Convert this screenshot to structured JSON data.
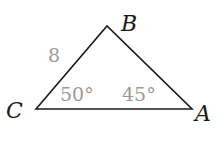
{
  "diagram": {
    "type": "triangle",
    "vertices": [
      {
        "name": "A",
        "label": "A"
      },
      {
        "name": "B",
        "label": "B"
      },
      {
        "name": "C",
        "label": "C"
      }
    ],
    "side_labels": {
      "CB": "8"
    },
    "angle_labels": {
      "C": "50°",
      "A": "45°"
    },
    "colors": {
      "stroke": "#1a1a1a",
      "measure_text": "#9a9a9a"
    }
  }
}
